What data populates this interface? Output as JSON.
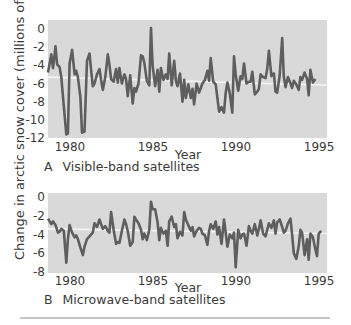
{
  "y_axis_label": "Change in arctic snow cover (millions of km²)",
  "rule_color": "#8a8a8a",
  "colors": {
    "plot_bg": "#d9d9d9",
    "line": "#5e5e5e",
    "trend": "#f4f4f4",
    "text": "#3a3a3a"
  },
  "chart_data": [
    {
      "type": "line",
      "panel": "A",
      "title": "Visible-band satellites",
      "xlabel": "Year",
      "ylabel": "Change in arctic snow cover (millions of km²)",
      "xlim": [
        1978.8,
        1995.6
      ],
      "ylim": [
        -12,
        0.9
      ],
      "xticks": [
        1980,
        1985,
        1990,
        1995
      ],
      "yticks": [
        0,
        -2,
        -4,
        -6,
        -8,
        -10,
        -12
      ],
      "grid": false,
      "trend_line": {
        "x": [
          1978.8,
          1995.6
        ],
        "y": [
          -5.3,
          -6.2
        ]
      },
      "series": [
        {
          "name": "Visible-band",
          "x": [
            1978.8,
            1979.0,
            1979.1,
            1979.25,
            1979.35,
            1979.5,
            1979.6,
            1979.75,
            1979.9,
            1980.0,
            1980.1,
            1980.25,
            1980.4,
            1980.5,
            1980.6,
            1980.75,
            1980.85,
            1981.0,
            1981.15,
            1981.3,
            1981.4,
            1981.5,
            1981.6,
            1981.75,
            1981.9,
            1982.0,
            1982.1,
            1982.25,
            1982.4,
            1982.5,
            1982.6,
            1982.75,
            1982.9,
            1983.0,
            1983.1,
            1983.25,
            1983.4,
            1983.5,
            1983.6,
            1983.75,
            1983.9,
            1984.0,
            1984.1,
            1984.25,
            1984.4,
            1984.5,
            1984.6,
            1984.75,
            1984.9,
            1985.0,
            1985.1,
            1985.25,
            1985.4,
            1985.5,
            1985.6,
            1985.75,
            1985.9,
            1986.0,
            1986.1,
            1986.25,
            1986.4,
            1986.5,
            1986.6,
            1986.75,
            1986.9,
            1987.0,
            1987.1,
            1987.25,
            1987.4,
            1987.5,
            1987.6,
            1987.75,
            1987.9,
            1988.0,
            1988.1,
            1988.25,
            1988.4,
            1988.5,
            1988.6,
            1988.75,
            1988.9,
            1989.0,
            1989.1,
            1989.25,
            1989.4,
            1989.5,
            1989.6,
            1989.75,
            1989.9,
            1990.0,
            1990.1,
            1990.25,
            1990.4,
            1990.5,
            1990.6,
            1990.75,
            1990.9,
            1991.0,
            1991.1,
            1991.25,
            1991.4,
            1991.5,
            1991.6,
            1991.75,
            1991.9,
            1992.0,
            1992.1,
            1992.25,
            1992.4,
            1992.5,
            1992.6,
            1992.75,
            1992.9,
            1993.0,
            1993.1,
            1993.25,
            1993.4,
            1993.5,
            1993.6,
            1993.75,
            1993.9,
            1994.0,
            1994.1,
            1994.25,
            1994.4,
            1994.5,
            1994.6,
            1994.75,
            1994.9,
            1995.0,
            1995.1,
            1995.25,
            1995.4,
            1995.6
          ],
          "values": [
            -4.8,
            -2.8,
            -4.3,
            -1.9,
            -3.9,
            -4.2,
            -5.3,
            -8.5,
            -11.6,
            -11.5,
            -3.8,
            -2.3,
            -5.0,
            -4.6,
            -5.3,
            -7.5,
            -11.4,
            -11.3,
            -3.5,
            -2.7,
            -4.6,
            -6.3,
            -6.0,
            -5.0,
            -4.4,
            -5.6,
            -6.7,
            -5.3,
            -2.8,
            -3.9,
            -5.5,
            -5.8,
            -4.4,
            -5.9,
            -4.3,
            -6.0,
            -5.0,
            -5.5,
            -7.4,
            -5.1,
            -8.2,
            -6.5,
            -6.9,
            -6.0,
            -2.9,
            -3.0,
            -3.7,
            -5.7,
            -6.2,
            0.1,
            -4.0,
            -6.3,
            -4.5,
            -6.9,
            -4.3,
            -5.6,
            -5.0,
            -5.5,
            -2.7,
            -6.2,
            -3.5,
            -5.7,
            -6.3,
            -4.9,
            -8.0,
            -5.6,
            -7.6,
            -6.1,
            -7.6,
            -6.6,
            -8.3,
            -6.0,
            -7.0,
            -6.5,
            -6.0,
            -5.6,
            -4.6,
            -5.7,
            -3.2,
            -5.8,
            -6.1,
            -7.6,
            -9.1,
            -8.6,
            -9.2,
            -7.0,
            -5.9,
            -7.1,
            -9.2,
            -3.0,
            -5.0,
            -6.8,
            -5.2,
            -5.5,
            -3.8,
            -6.0,
            -5.8,
            -5.8,
            -4.7,
            -7.2,
            -6.9,
            -6.6,
            -5.0,
            -5.3,
            -5.4,
            -4.4,
            -2.4,
            -5.2,
            -4.9,
            -6.9,
            -7.0,
            -5.1,
            -1.0,
            -5.2,
            -6.4,
            -5.3,
            -6.0,
            -6.5,
            -5.7,
            -6.1,
            -6.7,
            -5.3,
            -5.6,
            -4.8,
            -5.5,
            -7.3,
            -4.5,
            -5.9,
            -5.5
          ],
          "note": "values estimated from pixels; series is approximate"
        }
      ]
    },
    {
      "type": "line",
      "panel": "B",
      "title": "Microwave-band satellites",
      "xlabel": "Year",
      "ylabel": "Change in arctic snow cover (millions of km²)",
      "xlim": [
        1978.8,
        1995.6
      ],
      "ylim": [
        -8,
        0.4
      ],
      "xticks": [
        1980,
        1985,
        1990,
        1995
      ],
      "yticks": [
        0,
        -2,
        -4,
        -6,
        -8
      ],
      "grid": false,
      "trend_line": {
        "x": [
          1978.8,
          1995.6
        ],
        "y": [
          -3.4,
          -3.9
        ]
      },
      "series": [
        {
          "name": "Microwave-band",
          "x": [
            1978.8,
            1979.0,
            1979.1,
            1979.25,
            1979.4,
            1979.5,
            1979.6,
            1979.75,
            1979.9,
            1980.0,
            1980.1,
            1980.25,
            1980.4,
            1980.5,
            1980.6,
            1980.75,
            1980.9,
            1981.0,
            1981.15,
            1981.3,
            1981.5,
            1981.6,
            1981.75,
            1981.9,
            1982.0,
            1982.1,
            1982.25,
            1982.4,
            1982.5,
            1982.6,
            1982.75,
            1982.9,
            1983.0,
            1983.1,
            1983.25,
            1983.4,
            1983.5,
            1983.6,
            1983.75,
            1983.9,
            1984.0,
            1984.1,
            1984.25,
            1984.4,
            1984.5,
            1984.6,
            1984.75,
            1984.9,
            1985.0,
            1985.1,
            1985.25,
            1985.4,
            1985.5,
            1985.6,
            1985.75,
            1985.9,
            1986.0,
            1986.1,
            1986.25,
            1986.4,
            1986.5,
            1986.6,
            1986.75,
            1986.9,
            1987.0,
            1987.1,
            1987.25,
            1987.4,
            1987.5,
            1987.6,
            1987.75,
            1987.9,
            1988.0,
            1988.1,
            1988.25,
            1988.4,
            1988.5,
            1988.6,
            1988.75,
            1988.9,
            1989.0,
            1989.1,
            1989.25,
            1989.4,
            1989.5,
            1989.6,
            1989.75,
            1989.9,
            1990.0,
            1990.1,
            1990.25,
            1990.4,
            1990.5,
            1990.6,
            1990.75,
            1990.9,
            1991.0,
            1991.1,
            1991.25,
            1991.4,
            1991.5,
            1991.6,
            1991.75,
            1991.9,
            1992.0,
            1992.1,
            1992.25,
            1992.4,
            1992.5,
            1992.6,
            1992.75,
            1992.9,
            1993.0,
            1993.1,
            1993.25,
            1993.4,
            1993.5,
            1993.6,
            1993.75,
            1993.9,
            1994.0,
            1994.1,
            1994.25,
            1994.4,
            1994.5,
            1994.6,
            1994.75,
            1994.9,
            1995.0,
            1995.1,
            1995.25,
            1995.4,
            1995.6
          ],
          "values": [
            -2.3,
            -2.9,
            -2.6,
            -3.0,
            -3.8,
            -3.7,
            -3.4,
            -3.6,
            -7.0,
            -4.5,
            -3.0,
            -3.8,
            -4.3,
            -4.1,
            -4.5,
            -5.4,
            -6.2,
            -5.3,
            -4.5,
            -4.2,
            -3.8,
            -2.8,
            -3.2,
            -2.4,
            -2.9,
            -3.4,
            -3.1,
            -3.6,
            -3.8,
            -1.6,
            -3.5,
            -5.0,
            -4.8,
            -4.9,
            -3.6,
            -2.4,
            -2.9,
            -3.6,
            -5.2,
            -4.8,
            -2.1,
            -2.4,
            -2.8,
            -3.5,
            -4.5,
            -3.9,
            -4.6,
            -3.5,
            -0.5,
            -1.3,
            -1.3,
            -2.7,
            -4.6,
            -3.3,
            -3.9,
            -3.6,
            -5.2,
            -2.6,
            -2.1,
            -3.2,
            -2.9,
            -4.4,
            -3.7,
            -4.1,
            -1.6,
            -2.4,
            -3.0,
            -3.6,
            -3.2,
            -4.2,
            -3.6,
            -3.3,
            -3.4,
            -3.9,
            -4.1,
            -5.1,
            -3.6,
            -2.9,
            -3.4,
            -2.6,
            -4.0,
            -3.2,
            -5.0,
            -2.4,
            -3.8,
            -5.3,
            -4.0,
            -4.4,
            -3.8,
            -7.5,
            -3.5,
            -4.4,
            -4.0,
            -3.9,
            -5.2,
            -3.1,
            -3.6,
            -3.9,
            -2.9,
            -4.1,
            -3.4,
            -2.5,
            -3.9,
            -4.2,
            -3.5,
            -2.8,
            -3.3,
            -2.5,
            -3.9,
            -2.7,
            -2.4,
            -3.2,
            -3.8,
            -3.6,
            -2.8,
            -2.3,
            -4.0,
            -6.0,
            -6.6,
            -5.2,
            -3.5,
            -3.8,
            -6.2,
            -4.5,
            -6.7,
            -3.9,
            -4.3,
            -5.6,
            -6.3,
            -3.9,
            -3.6
          ],
          "note": "values estimated from pixels; series is approximate"
        }
      ]
    }
  ]
}
